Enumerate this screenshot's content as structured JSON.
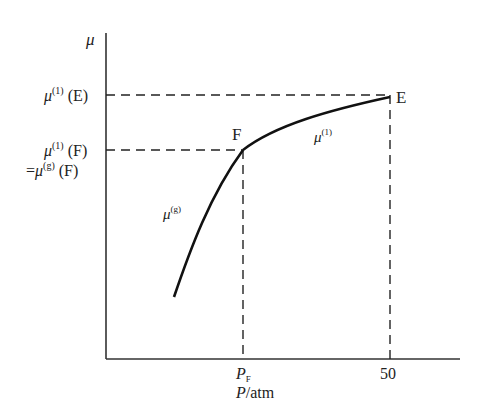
{
  "diagram": {
    "type": "chemical potential vs pressure plot",
    "y_axis": {
      "label": "μ"
    },
    "x_axis": {
      "label_var": "P",
      "label_unit": "atm",
      "ticks": [
        {
          "label_var": "P",
          "label_sub": "F"
        },
        {
          "label": "50"
        }
      ]
    },
    "y_ticks": [
      {
        "mu": "μ",
        "sup": "(1)",
        "arg": "(E)"
      },
      {
        "mu": "μ",
        "sup": "(1)",
        "arg": "(F)"
      },
      {
        "prefix": "=",
        "mu": "μ",
        "sup": "(g)",
        "arg": "(F)"
      }
    ],
    "points": [
      {
        "label": "F"
      },
      {
        "label": "E"
      }
    ],
    "curves": [
      {
        "name": "gas",
        "mu": "μ",
        "sup": "(g)"
      },
      {
        "name": "liquid",
        "mu": "μ",
        "sup": "(1)"
      }
    ]
  }
}
